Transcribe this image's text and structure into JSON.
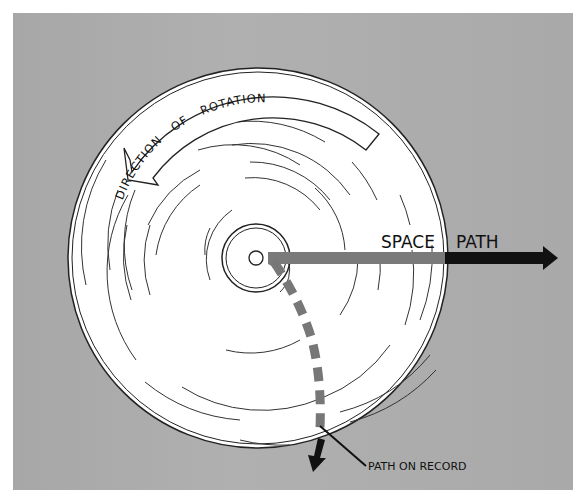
{
  "diagram": {
    "type": "record-rotation-path-illustration",
    "labels": {
      "rotation": "DIRECTION OF ROTATION",
      "rotation_words": [
        "DIRECTION",
        "OF",
        "ROTATION"
      ],
      "space_path_1": "SPACE",
      "space_path_2": "PATH",
      "record_path": "PATH ON RECORD"
    },
    "colors": {
      "background": "#a9a9a9",
      "record": "#ffffff",
      "grooves": "#333333",
      "space_path_inside": "#7a7a7a",
      "space_path_outside": "#111111",
      "record_path": "#777777",
      "record_path_tip": "#111111"
    },
    "record": {
      "center": [
        258,
        258
      ],
      "radius": 190,
      "spindle_radius": 8,
      "label_radius": 34
    }
  }
}
